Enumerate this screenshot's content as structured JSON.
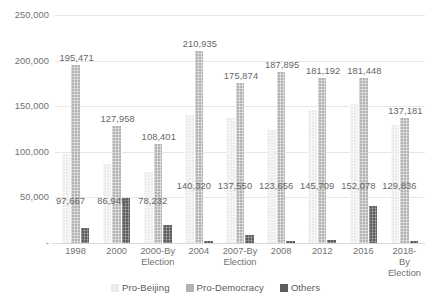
{
  "chart_data": {
    "type": "bar",
    "title": "",
    "subtitle": "",
    "xlabel": "",
    "ylabel": "",
    "ylim": [
      0,
      250000
    ],
    "grid": true,
    "legend_position": "bottom",
    "y_ticks": [
      "-",
      "50,000",
      "100,000",
      "150,000",
      "200,000",
      "250,000"
    ],
    "y_tick_values": [
      0,
      50000,
      100000,
      150000,
      200000,
      250000
    ],
    "categories": [
      "1998",
      "2000",
      "2000-By\nElection",
      "2004",
      "2007-By\nElection",
      "2008",
      "2012",
      "2016",
      "2018-By\nElection"
    ],
    "series": [
      {
        "name": "Pro-Beijing",
        "color": "#ebebeb",
        "values": [
          97667,
          86949,
          78232,
          140320,
          137550,
          123656,
          145709,
          152078,
          129836
        ],
        "labels": [
          "97,667",
          "86,949",
          "78,232",
          "140,320",
          "137,550",
          "123,656",
          "145,709",
          "152,078",
          "129,836"
        ]
      },
      {
        "name": "Pro-Democracy",
        "color": "#b3b3b3",
        "values": [
          195471,
          127958,
          108401,
          210935,
          175874,
          187895,
          181192,
          181448,
          137181
        ],
        "labels": [
          "195,471",
          "127,958",
          "108,401",
          "210,935",
          "175,874",
          "187,895",
          "181,192",
          "181,448",
          "137,181"
        ]
      },
      {
        "name": "Others",
        "color": "#5e5e5e",
        "values": [
          16200,
          49800,
          19500,
          2200,
          8600,
          1800,
          3200,
          40400,
          2600
        ],
        "labels": [
          "",
          "",
          "",
          "",
          "",
          "",
          "",
          "",
          ""
        ]
      }
    ]
  }
}
